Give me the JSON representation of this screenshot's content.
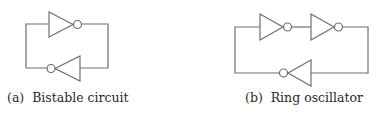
{
  "figures": [
    {
      "id": "a",
      "label": "(a)",
      "caption": "Bistable circuit",
      "caption_full": "(a)  Bistable circuit",
      "inverter_count": 2
    },
    {
      "id": "b",
      "label": "(b)",
      "caption": "Ring oscillator",
      "caption_full": "(b)  Ring oscillator",
      "inverter_count": 3
    }
  ],
  "colors": {
    "line": "#6e6e6e",
    "text": "#2a2a2a",
    "background": "#ffffff"
  }
}
